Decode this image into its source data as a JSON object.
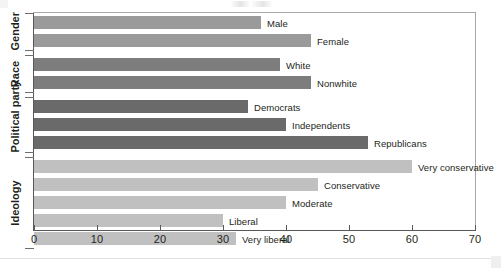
{
  "chart_data": {
    "type": "bar",
    "orientation": "horizontal",
    "title": "",
    "xlabel": "",
    "ylabel": "",
    "xlim": [
      0,
      70
    ],
    "xticks": [
      0,
      10,
      20,
      30,
      40,
      50,
      60,
      70
    ],
    "grid": false,
    "legend": false,
    "groups": [
      {
        "name": "Gender",
        "color": "#9a9a9a",
        "categories": [
          "Male",
          "Female"
        ],
        "values": [
          36,
          44
        ]
      },
      {
        "name": "Race",
        "color": "#7d7d7d",
        "categories": [
          "White",
          "Nonwhite"
        ],
        "values": [
          39,
          44
        ]
      },
      {
        "name": "Political party",
        "color": "#6a6a6a",
        "categories": [
          "Democrats",
          "Independents",
          "Republicans"
        ],
        "values": [
          34,
          40,
          53
        ]
      },
      {
        "name": "Ideology",
        "color": "#c0c0c0",
        "categories": [
          "Very conservative",
          "Conservative",
          "Moderate",
          "Liberal",
          "Very liberal"
        ],
        "values": [
          60,
          45,
          40,
          30,
          32
        ]
      }
    ],
    "bars": [
      {
        "label": "Male",
        "value": 36,
        "group": "Gender",
        "color": "#9a9a9a"
      },
      {
        "label": "Female",
        "value": 44,
        "group": "Gender",
        "color": "#9a9a9a"
      },
      {
        "label": "White",
        "value": 39,
        "group": "Race",
        "color": "#7d7d7d"
      },
      {
        "label": "Nonwhite",
        "value": 44,
        "group": "Race",
        "color": "#7d7d7d"
      },
      {
        "label": "Democrats",
        "value": 34,
        "group": "Political party",
        "color": "#6a6a6a"
      },
      {
        "label": "Independents",
        "value": 40,
        "group": "Political party",
        "color": "#6a6a6a"
      },
      {
        "label": "Republicans",
        "value": 53,
        "group": "Political party",
        "color": "#6a6a6a"
      },
      {
        "label": "Very conservative",
        "value": 60,
        "group": "Ideology",
        "color": "#c0c0c0"
      },
      {
        "label": "Conservative",
        "value": 45,
        "group": "Ideology",
        "color": "#c0c0c0"
      },
      {
        "label": "Moderate",
        "value": 40,
        "group": "Ideology",
        "color": "#c0c0c0"
      },
      {
        "label": "Liberal",
        "value": 30,
        "group": "Ideology",
        "color": "#c0c0c0"
      },
      {
        "label": "Very liberal",
        "value": 32,
        "group": "Ideology",
        "color": "#c0c0c0"
      }
    ]
  },
  "axis": {
    "tick_labels": [
      "0",
      "10",
      "20",
      "30",
      "40",
      "50",
      "60",
      "70"
    ]
  },
  "group_labels": [
    "Gender",
    "Race",
    "Political party",
    "Ideology"
  ]
}
